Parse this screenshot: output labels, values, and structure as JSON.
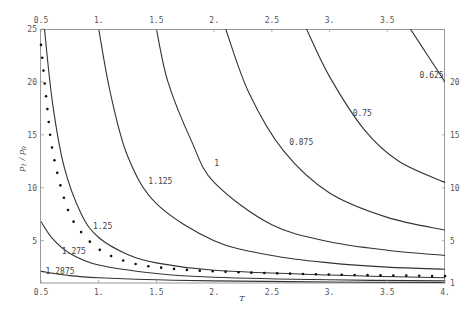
{
  "chart_data": {
    "type": "line",
    "title": "",
    "xlabel": "T",
    "ylabel": "p1/p0",
    "xlim": [
      0.5,
      4.0
    ],
    "ylim": [
      1,
      25
    ],
    "grid": false,
    "legend": "none (curves labeled inline)",
    "x_ticks": [
      "0.5",
      "1.",
      "1.5",
      "2.",
      "2.5",
      "3.",
      "3.5",
      "4."
    ],
    "x_ticks_top": [
      "0.5",
      "1.",
      "1.5",
      "2.",
      "2.5",
      "3.",
      "3.5"
    ],
    "y_ticks_left": [
      "5",
      "10",
      "15",
      "20",
      "25"
    ],
    "y_ticks_right": [
      "1",
      "5",
      "10",
      "15",
      "20"
    ],
    "series": [
      {
        "name": "0.625",
        "style": "solid",
        "points": [
          [
            3.7,
            25
          ],
          [
            3.85,
            22.5
          ],
          [
            4.0,
            20.0
          ]
        ]
      },
      {
        "name": "0.75",
        "style": "solid",
        "points": [
          [
            2.8,
            25
          ],
          [
            3.0,
            20.5
          ],
          [
            3.3,
            15.5
          ],
          [
            3.6,
            12.5
          ],
          [
            4.0,
            10.5
          ]
        ]
      },
      {
        "name": "0.875",
        "style": "solid",
        "points": [
          [
            2.1,
            25
          ],
          [
            2.3,
            19
          ],
          [
            2.6,
            13.5
          ],
          [
            3.0,
            9.5
          ],
          [
            3.5,
            7.2
          ],
          [
            4.0,
            6.0
          ]
        ]
      },
      {
        "name": "1",
        "style": "solid",
        "points": [
          [
            1.5,
            25
          ],
          [
            1.6,
            20
          ],
          [
            1.8,
            14.5
          ],
          [
            2.0,
            10.5
          ],
          [
            2.5,
            6.5
          ],
          [
            3.0,
            4.9
          ],
          [
            3.5,
            4.1
          ],
          [
            4.0,
            3.6
          ]
        ]
      },
      {
        "name": "1.125",
        "style": "solid",
        "points": [
          [
            1.0,
            25
          ],
          [
            1.1,
            19
          ],
          [
            1.25,
            13
          ],
          [
            1.5,
            8.5
          ],
          [
            2.0,
            5.0
          ],
          [
            2.5,
            3.6
          ],
          [
            3.0,
            2.9
          ],
          [
            3.5,
            2.5
          ],
          [
            4.0,
            2.3
          ]
        ]
      },
      {
        "name": "1.25",
        "style": "solid",
        "points": [
          [
            0.53,
            25
          ],
          [
            0.6,
            18
          ],
          [
            0.7,
            12
          ],
          [
            0.85,
            7.5
          ],
          [
            1.0,
            5.3
          ],
          [
            1.25,
            3.7
          ],
          [
            1.5,
            2.9
          ],
          [
            2.0,
            2.2
          ],
          [
            3.0,
            1.75
          ],
          [
            4.0,
            1.5
          ]
        ]
      },
      {
        "name": "limit (dotted)",
        "style": "dotted",
        "points": [
          [
            0.5,
            23.5
          ],
          [
            0.55,
            18
          ],
          [
            0.6,
            13.5
          ],
          [
            0.7,
            9
          ],
          [
            0.8,
            6.5
          ],
          [
            1.0,
            4.2
          ],
          [
            1.25,
            3.0
          ],
          [
            1.5,
            2.5
          ],
          [
            2.0,
            2.1
          ],
          [
            3.0,
            1.8
          ],
          [
            4.0,
            1.65
          ]
        ]
      },
      {
        "name": "1.275",
        "style": "solid",
        "points": [
          [
            0.5,
            6.8
          ],
          [
            0.6,
            5.2
          ],
          [
            0.75,
            3.8
          ],
          [
            1.0,
            2.7
          ],
          [
            1.5,
            1.9
          ],
          [
            2.0,
            1.55
          ],
          [
            3.0,
            1.3
          ],
          [
            4.0,
            1.2
          ]
        ]
      },
      {
        "name": "1.2875",
        "style": "solid",
        "points": [
          [
            0.5,
            2.1
          ],
          [
            0.75,
            1.7
          ],
          [
            1.0,
            1.5
          ],
          [
            1.5,
            1.3
          ],
          [
            2.0,
            1.2
          ],
          [
            3.0,
            1.1
          ],
          [
            4.0,
            1.05
          ]
        ]
      }
    ],
    "annotations": [
      {
        "text": "0.625",
        "x": 3.78,
        "y": 20.4
      },
      {
        "text": "0.75",
        "x": 3.2,
        "y": 16.8
      },
      {
        "text": "0.875",
        "x": 2.65,
        "y": 14.0
      },
      {
        "text": "1",
        "x": 2.0,
        "y": 12.1
      },
      {
        "text": "1.125",
        "x": 1.43,
        "y": 10.4
      },
      {
        "text": "1.25",
        "x": 0.95,
        "y": 6.1
      },
      {
        "text": "1.275",
        "x": 0.68,
        "y": 3.7
      },
      {
        "text": "1.2875",
        "x": 0.54,
        "y": 1.85
      }
    ]
  }
}
